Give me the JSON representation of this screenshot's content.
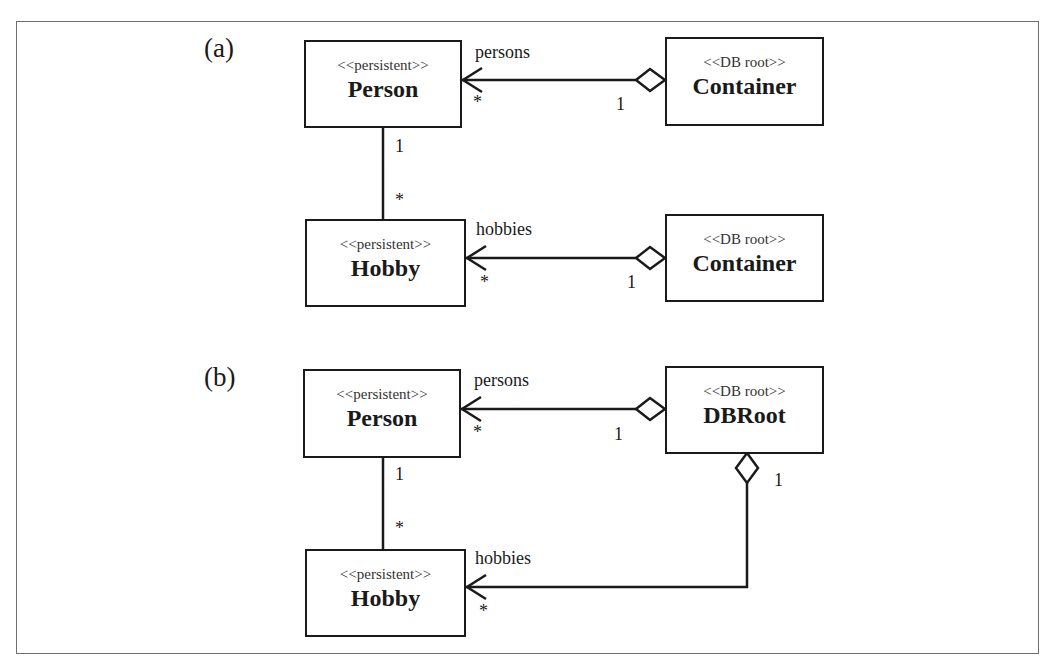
{
  "panels": [
    {
      "label": "(a)",
      "classes": {
        "person": {
          "stereotype": "<<persistent>>",
          "name": "Person"
        },
        "hobby": {
          "stereotype": "<<persistent>>",
          "name": "Hobby"
        },
        "container1": {
          "stereotype": "<<DB root>>",
          "name": "Container"
        },
        "container2": {
          "stereotype": "<<DB root>>",
          "name": "Container"
        }
      },
      "associations": {
        "persons": {
          "role": "persons",
          "target_mult": "*",
          "source_mult": "1"
        },
        "hobbies": {
          "role": "hobbies",
          "target_mult": "*",
          "source_mult": "1"
        },
        "person_hobby": {
          "person_mult": "1",
          "hobby_mult": "*"
        }
      }
    },
    {
      "label": "(b)",
      "classes": {
        "person": {
          "stereotype": "<<persistent>>",
          "name": "Person"
        },
        "hobby": {
          "stereotype": "<<persistent>>",
          "name": "Hobby"
        },
        "dbroot": {
          "stereotype": "<<DB root>>",
          "name": "DBRoot"
        }
      },
      "associations": {
        "persons": {
          "role": "persons",
          "target_mult": "*",
          "source_mult": "1"
        },
        "hobbies": {
          "role": "hobbies",
          "target_mult": "*",
          "source_mult": "1"
        },
        "person_hobby": {
          "person_mult": "1",
          "hobby_mult": "*"
        }
      }
    }
  ],
  "colors": {
    "line": "#1a1a1a",
    "frame": "#6e6e6e",
    "background": "#ffffff"
  }
}
